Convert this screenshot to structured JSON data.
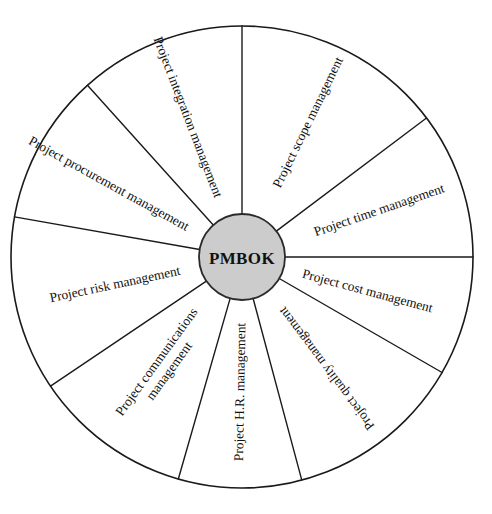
{
  "diagram": {
    "hub_label": "PMBOK",
    "hub_fill": "#cccccc",
    "stroke_color": "#1a1a1a",
    "background": "#ffffff",
    "center": {
      "x": 242,
      "y": 257
    },
    "outer_radius": 231,
    "hub_radius": 43,
    "sectors": [
      {
        "id": "integration",
        "label": "Project integration management",
        "lines": [
          "Project integration management"
        ],
        "start_angle": -90,
        "end_angle": -132,
        "label_angle": -111,
        "label_rotation": 69,
        "label_radius": 150
      },
      {
        "id": "procurement",
        "label": "Project procurement management",
        "lines": [
          "Project procurement management"
        ],
        "start_angle": -132,
        "end_angle": -170,
        "label_angle": -151,
        "label_rotation": 29,
        "label_radius": 152
      },
      {
        "id": "risk",
        "label": "Project risk management",
        "lines": [
          "Project risk management"
        ],
        "start_angle": -170,
        "end_angle": -214,
        "label_angle": -192,
        "label_rotation": -12,
        "label_radius": 130
      },
      {
        "id": "communications",
        "label": "Project communications management",
        "lines": [
          "Project communications",
          "management"
        ],
        "start_angle": -214,
        "end_angle": -254,
        "label_angle": -234,
        "label_rotation": -54,
        "label_radius": 135
      },
      {
        "id": "hr",
        "label": "Project H.R. management",
        "lines": [
          "Project H.R. management"
        ],
        "start_angle": -254,
        "end_angle": -285,
        "label_angle": -269,
        "label_rotation": -89,
        "label_radius": 135
      },
      {
        "id": "quality",
        "label": "Project quality management",
        "lines": [
          "Project quality management"
        ],
        "start_angle": -285,
        "end_angle": -330,
        "label_angle": -307,
        "label_rotation": -127,
        "label_radius": 140
      },
      {
        "id": "cost",
        "label": "Project cost management",
        "lines": [
          "Project cost management"
        ],
        "start_angle": -330,
        "end_angle": -360,
        "label_angle": -345,
        "label_rotation": 15,
        "label_radius": 130
      },
      {
        "id": "time",
        "label": "Project time management",
        "lines": [
          "Project time management"
        ],
        "start_angle": 0,
        "end_angle": -37,
        "label_angle": -19,
        "label_rotation": -19,
        "label_radius": 145
      },
      {
        "id": "scope",
        "label": "Project scope management",
        "lines": [
          "Project scope management"
        ],
        "start_angle": -37,
        "end_angle": -90,
        "label_angle": -64,
        "label_rotation": -64,
        "label_radius": 150
      }
    ]
  }
}
